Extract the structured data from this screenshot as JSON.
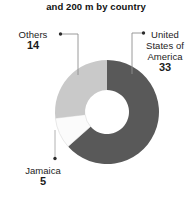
{
  "chart_data": {
    "type": "pie",
    "variant": "donut",
    "title": "and 200 m by country",
    "xlabel": "",
    "ylabel": "",
    "legend_position": "callout-labels",
    "grid": false,
    "total": 52,
    "categories": [
      "United States of America",
      "Jamaica",
      "Others"
    ],
    "values": [
      33,
      5,
      14
    ],
    "slices": [
      {
        "label": "United States of America",
        "value": 33,
        "color": "#595959",
        "start_angle_deg": 0,
        "end_angle_deg": 228.5
      },
      {
        "label": "Jamaica",
        "value": 5,
        "color": "#fbfbfb",
        "start_angle_deg": 228.5,
        "end_angle_deg": 263.1
      },
      {
        "label": "Others",
        "value": 14,
        "color": "#c9c9c9",
        "start_angle_deg": 263.1,
        "end_angle_deg": 360
      }
    ]
  },
  "title": {
    "text": "and 200 m by country"
  },
  "callouts": {
    "others": {
      "category": "Others",
      "value": "14"
    },
    "usa": {
      "category": "United States of America",
      "value": "33"
    },
    "jamaica": {
      "category": "Jamaica",
      "value": "5"
    }
  },
  "colors": {
    "usa_slice": "#595959",
    "jamaica_slice": "#fbfbfb",
    "others_slice": "#c9c9c9",
    "leader_line": "#8e8e8e",
    "background": "#ffffff",
    "text": "#1a1a1a"
  }
}
